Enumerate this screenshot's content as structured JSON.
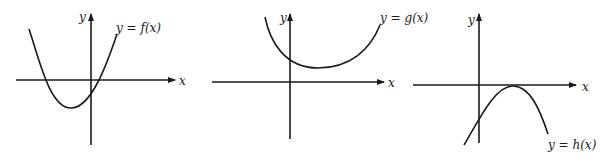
{
  "graphs": [
    {
      "id": "f",
      "axis_x_label": "x",
      "axis_y_label": "y",
      "curve_label": "y = f(x)",
      "description": "Upward-opening parabola with vertex below x-axis, left of y-axis; two x-intercepts, negative y-intercept"
    },
    {
      "id": "g",
      "axis_x_label": "x",
      "axis_y_label": "y",
      "curve_label": "y = g(x)",
      "description": "Upward-opening parabola with vertex above x-axis, right of y-axis; no x-intercepts, positive y-intercept"
    },
    {
      "id": "h",
      "axis_x_label": "x",
      "axis_y_label": "y",
      "curve_label": "y = h(x)",
      "description": "Downward-opening parabola with vertex touching x-axis, right of y-axis; one x-intercept (tangent), negative y-intercept"
    }
  ]
}
